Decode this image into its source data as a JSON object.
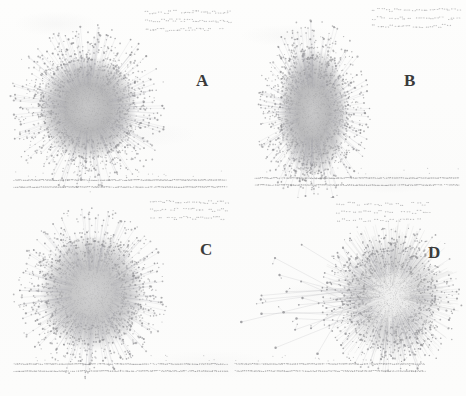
{
  "figure": {
    "type": "multi-panel-network-figure",
    "layout": "2x2",
    "width": 466,
    "height": 396,
    "background_color": "#fcfcfb",
    "node_color": "#8f8f92",
    "edge_color": "#a6a6a9",
    "label_color": "#3b3b3b",
    "medium": "scanned-page"
  },
  "panels": [
    {
      "id": "a",
      "label": "A",
      "label_x": 196,
      "label_y": 72,
      "description": "dense circular hairball network with radiating periphery",
      "giant_component": {
        "center_x": 88,
        "center_y": 108,
        "radius_x": 58,
        "radius_y": 62,
        "core_radius_x": 34,
        "core_radius_y": 36,
        "shape": "circular",
        "node_count": 1900,
        "periphery_node_count": 330,
        "core_opacity": 0.62
      },
      "small_components": {
        "position": "top-right",
        "x": 146,
        "y": 12,
        "width": 86,
        "height": 26,
        "count": 64
      },
      "isolate_band": {
        "position": "bottom",
        "x": 14,
        "y": 180,
        "width": 212,
        "height": 14,
        "rows": 2,
        "count": 230
      }
    },
    {
      "id": "b",
      "label": "B",
      "label_x": 404,
      "label_y": 72,
      "description": "vertically elongated dense network cluster",
      "giant_component": {
        "center_x": 80,
        "center_y": 112,
        "radius_x": 42,
        "radius_y": 68,
        "core_radius_x": 24,
        "core_radius_y": 44,
        "shape": "elongated-vertical",
        "node_count": 1800,
        "periphery_node_count": 300,
        "core_opacity": 0.6
      },
      "small_components": {
        "position": "top-right",
        "x": 140,
        "y": 10,
        "width": 88,
        "height": 24,
        "count": 58
      },
      "isolate_band": {
        "position": "bottom",
        "x": 22,
        "y": 178,
        "width": 204,
        "height": 14,
        "rows": 2,
        "count": 220
      }
    },
    {
      "id": "c",
      "label": "C",
      "label_x": 200,
      "label_y": 241,
      "description": "round granular network cluster with lighter center",
      "giant_component": {
        "center_x": 92,
        "center_y": 95,
        "radius_x": 56,
        "radius_y": 62,
        "core_radius_x": 36,
        "core_radius_y": 40,
        "shape": "circular-granular",
        "node_count": 1750,
        "periphery_node_count": 340,
        "core_opacity": 0.5
      },
      "small_components": {
        "position": "top-right",
        "x": 150,
        "y": 4,
        "width": 80,
        "height": 24,
        "count": 56
      },
      "isolate_band": {
        "position": "bottom",
        "x": 14,
        "y": 166,
        "width": 214,
        "height": 14,
        "rows": 2,
        "count": 225
      }
    },
    {
      "id": "d",
      "label": "D",
      "label_x": 428,
      "label_y": 244,
      "description": "radial starburst hub with long edges to distant peripheral nodes on the left",
      "giant_component": {
        "center_x": 158,
        "center_y": 98,
        "radius_x": 52,
        "radius_y": 58,
        "core_radius_x": 34,
        "core_radius_y": 40,
        "shape": "radial-starburst",
        "node_count": 1500,
        "periphery_node_count": 260,
        "core_opacity": 0.3,
        "spoke_count": 260
      },
      "long_edges": {
        "count": 26,
        "origin_x": 140,
        "origin_y": 100,
        "target_region_x": 8,
        "target_region_y": 45,
        "target_region_width": 110,
        "target_region_height": 115
      },
      "small_components": {
        "position": "top-right",
        "x": 104,
        "y": 6,
        "width": 96,
        "height": 24,
        "count": 52
      },
      "isolate_band": {
        "position": "bottom",
        "x": 2,
        "y": 166,
        "width": 190,
        "height": 14,
        "rows": 2,
        "count": 200
      }
    }
  ]
}
